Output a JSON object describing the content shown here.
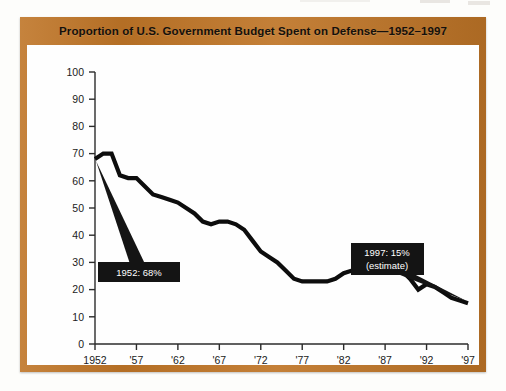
{
  "figure": {
    "title": "Proportion of U.S. Government Budget Spent on Defense—1952–1997",
    "frame_color": "#bf7527",
    "panel_color": "#fefefe"
  },
  "chart_data": {
    "type": "line",
    "title": "Proportion of U.S. Government Budget Spent on Defense—1952–1997",
    "xlabel": "",
    "ylabel": "",
    "xlim": [
      1952,
      1997
    ],
    "ylim": [
      0,
      100
    ],
    "grid": false,
    "legend": null,
    "line_color": "#0d0d0d",
    "y_ticks": [
      0,
      10,
      20,
      30,
      40,
      50,
      60,
      70,
      80,
      90,
      100
    ],
    "y_tick_labels": [
      "0",
      "10",
      "20",
      "30",
      "40",
      "50",
      "60",
      "70",
      "80",
      "90",
      "100"
    ],
    "x_ticks": [
      1952,
      1957,
      1962,
      1967,
      1972,
      1977,
      1982,
      1987,
      1992,
      1997
    ],
    "x_tick_labels": [
      "1952",
      "'57",
      "'62",
      "'67",
      "'72",
      "'77",
      "'82",
      "'87",
      "'92",
      "'97"
    ],
    "x": [
      1952,
      1953,
      1954,
      1955,
      1956,
      1957,
      1958,
      1959,
      1960,
      1961,
      1962,
      1963,
      1964,
      1965,
      1966,
      1967,
      1968,
      1969,
      1970,
      1971,
      1972,
      1973,
      1974,
      1975,
      1976,
      1977,
      1978,
      1979,
      1980,
      1981,
      1982,
      1983,
      1984,
      1985,
      1986,
      1987,
      1988,
      1989,
      1990,
      1991,
      1992,
      1993,
      1994,
      1995,
      1996,
      1997
    ],
    "values": [
      68,
      70,
      70,
      62,
      61,
      61,
      58,
      55,
      54,
      53,
      52,
      50,
      48,
      45,
      44,
      45,
      45,
      44,
      42,
      38,
      34,
      32,
      30,
      27,
      24,
      23,
      23,
      23,
      23,
      24,
      26,
      27,
      27,
      27,
      27,
      27,
      27,
      27,
      24,
      20,
      22,
      21,
      19,
      17,
      16,
      15
    ],
    "series": [
      {
        "name": "Defense share of U.S. federal budget (%)",
        "values": [
          68,
          70,
          70,
          62,
          61,
          61,
          58,
          55,
          54,
          53,
          52,
          50,
          48,
          45,
          44,
          45,
          45,
          44,
          42,
          38,
          34,
          32,
          30,
          27,
          24,
          23,
          23,
          23,
          23,
          24,
          26,
          27,
          27,
          27,
          27,
          27,
          27,
          27,
          24,
          20,
          22,
          21,
          19,
          17,
          16,
          15
        ]
      }
    ],
    "annotations": [
      {
        "id": "start-callout",
        "text_lines": [
          "1952: 68%"
        ],
        "points_to_year": 1952,
        "points_to_value": 68,
        "style": "black-box-white-text"
      },
      {
        "id": "end-callout",
        "text_lines": [
          "1997: 15%",
          "(estimate)"
        ],
        "points_to_year": 1997,
        "points_to_value": 15,
        "style": "black-box-white-text"
      }
    ]
  }
}
